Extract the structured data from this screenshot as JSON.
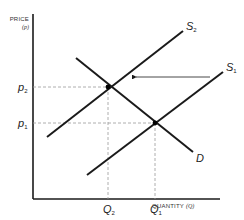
{
  "diagram": {
    "type": "supply-demand",
    "y_axis": {
      "label": "PRICE",
      "symbol": "(p)"
    },
    "x_axis": {
      "label": "QUANTITY",
      "symbol": "(Q)"
    },
    "curves": [
      {
        "id": "S2",
        "label": "S",
        "subscript": "2",
        "kind": "supply"
      },
      {
        "id": "S1",
        "label": "S",
        "subscript": "1",
        "kind": "supply"
      },
      {
        "id": "D",
        "label": "D",
        "subscript": "",
        "kind": "demand"
      }
    ],
    "price_levels": [
      {
        "label": "p",
        "subscript": "2"
      },
      {
        "label": "p",
        "subscript": "1"
      }
    ],
    "quantity_levels": [
      {
        "label": "Q",
        "subscript": "2"
      },
      {
        "label": "Q",
        "subscript": "1"
      }
    ],
    "annotation": "Arrow indicates supply shift leftward from S1 to S2",
    "colors": {
      "line": "#1a1a1a",
      "dashed": "#999999",
      "background": "#ffffff"
    }
  }
}
